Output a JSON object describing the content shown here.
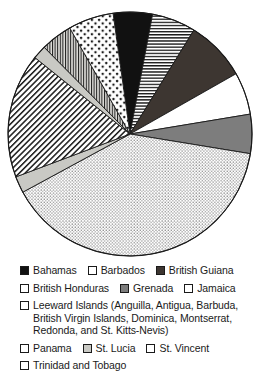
{
  "chart_data": {
    "type": "pie",
    "title": "",
    "subtitle": "",
    "xlabel": "",
    "ylabel": "",
    "grid": false,
    "legend_position": "bottom",
    "start_angle_deg": -8,
    "direction": "clockwise",
    "center": {
      "x": 130,
      "y": 134
    },
    "radius": 122,
    "categories": [
      "Bahamas",
      "Barbados",
      "British Guiana",
      "British Honduras",
      "Grenada",
      "Trinidad and Tobago",
      "St. Vincent",
      "Panama",
      "St. Lucia",
      "Leeward Islands",
      "Jamaica"
    ],
    "values": [
      5.2,
      5.8,
      8.0,
      5.6,
      5.2,
      39.5,
      2.2,
      16.5,
      1.8,
      4.2,
      16.0
    ],
    "slices": [
      {
        "label": "Bahamas",
        "value": 5.2,
        "start_deg": -8,
        "end_deg": 10.7,
        "pattern": "solid-black",
        "color": "#111111"
      },
      {
        "label": "Barbados",
        "value": 5.8,
        "start_deg": 10.7,
        "end_deg": 31.6,
        "pattern": "horizontal-lines",
        "color": "#ffffff"
      },
      {
        "label": "British Guiana",
        "value": 8.0,
        "start_deg": 31.6,
        "end_deg": 60.4,
        "pattern": "dark-gray",
        "color": "#3d3631"
      },
      {
        "label": "British Honduras",
        "value": 5.6,
        "start_deg": 60.4,
        "end_deg": 80.6,
        "pattern": "white",
        "color": "#ffffff"
      },
      {
        "label": "Grenada",
        "value": 5.2,
        "start_deg": 80.6,
        "end_deg": 99.3,
        "pattern": "mid-gray",
        "color": "#7d7d7d"
      },
      {
        "label": "Trinidad and Tobago",
        "value": 39.5,
        "start_deg": 99.3,
        "end_deg": 241.5,
        "pattern": "fine-stipple",
        "color": "#ffffff"
      },
      {
        "label": "St. Vincent",
        "value": 2.2,
        "start_deg": 241.5,
        "end_deg": 249.4,
        "pattern": "light-gray",
        "color": "#c9c9c4"
      },
      {
        "label": "Panama",
        "value": 16.5,
        "start_deg": 249.4,
        "end_deg": 308.8,
        "pattern": "diagonal-back",
        "color": "#ffffff"
      },
      {
        "label": "St. Lucia",
        "value": 1.8,
        "start_deg": 308.8,
        "end_deg": 315.3,
        "pattern": "light-gray",
        "color": "#c9c9c4"
      },
      {
        "label": "Leeward Islands",
        "value": 4.2,
        "start_deg": 315.3,
        "end_deg": 330.4,
        "pattern": "vertical-lines",
        "color": "#d8d8d4"
      },
      {
        "label": "Jamaica",
        "value": 16.0,
        "start_deg": 330.4,
        "end_deg": 352.0,
        "pattern": "coarse-dots",
        "color": "#ffffff"
      }
    ]
  },
  "legend": {
    "rows": [
      {
        "entries": [
          {
            "label": "Bahamas",
            "swatch": "solid-black"
          },
          {
            "label": "Barbados",
            "swatch": "horizontal-lines"
          },
          {
            "label": "British Guiana",
            "swatch": "dark-gray"
          }
        ]
      },
      {
        "entries": [
          {
            "label": "British Honduras",
            "swatch": "white"
          },
          {
            "label": "Grenada",
            "swatch": "mid-gray"
          },
          {
            "label": "Jamaica",
            "swatch": "coarse-dots"
          }
        ]
      },
      {
        "entries": [
          {
            "label": "Leeward Islands (Anguilla, Antigua, Barbuda, British Virgin Islands, Dominica, Montserrat, Redonda, and St. Kitts-Nevis)",
            "swatch": "vertical-lines",
            "wrapped": true
          }
        ]
      },
      {
        "entries": [
          {
            "label": "Panama",
            "swatch": "diagonal-back"
          },
          {
            "label": "St. Lucia",
            "swatch": "light-gray"
          },
          {
            "label": "St. Vincent",
            "swatch": "diagonal-fwd"
          }
        ]
      },
      {
        "entries": [
          {
            "label": "Trinidad and Tobago",
            "swatch": "fine-stipple"
          }
        ]
      }
    ]
  }
}
